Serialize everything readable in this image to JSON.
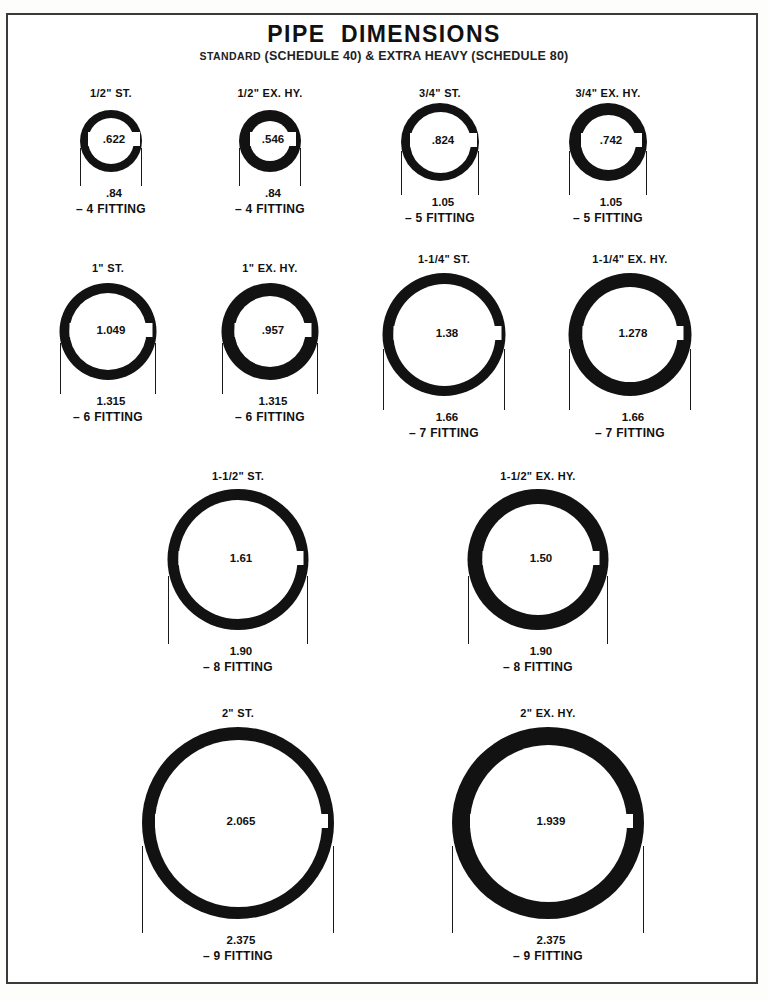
{
  "document": {
    "title": "PIPE  DIMENSIONS",
    "subtitle_small": "STANDARD",
    "subtitle_rest": "(SCHEDULE 40) & EXTRA HEAVY (SCHEDULE 80)",
    "border_color": "#3a3a3a",
    "ink_color": "#121212",
    "paper_color": "#ffffff"
  },
  "chart_data": {
    "type": "diagram",
    "title": "PIPE DIMENSIONS",
    "subtitle": "STANDARD (SCHEDULE 40) & EXTRA HEAVY (SCHEDULE 80)",
    "units": "inches",
    "scale_px_per_inch": 81,
    "columns": [
      "nominal_size",
      "schedule",
      "inside_diameter",
      "outside_diameter",
      "fitting"
    ],
    "pipes": [
      {
        "label": "1/2\" ST.",
        "nominal_size": "1/2\"",
        "schedule": "ST.",
        "id": ".622",
        "od": ".84",
        "fitting": "– 4 FITTING",
        "id_value": 0.622,
        "od_value": 0.84
      },
      {
        "label": "1/2\" EX. HY.",
        "nominal_size": "1/2\"",
        "schedule": "EX. HY.",
        "id": ".546",
        "od": ".84",
        "fitting": "– 4 FITTING",
        "id_value": 0.546,
        "od_value": 0.84
      },
      {
        "label": "3/4\" ST.",
        "nominal_size": "3/4\"",
        "schedule": "ST.",
        "id": ".824",
        "od": "1.05",
        "fitting": "– 5 FITTING",
        "id_value": 0.824,
        "od_value": 1.05
      },
      {
        "label": "3/4\" EX. HY.",
        "nominal_size": "3/4\"",
        "schedule": "EX. HY.",
        "id": ".742",
        "od": "1.05",
        "fitting": "– 5 FITTING",
        "id_value": 0.742,
        "od_value": 1.05
      },
      {
        "label": "1\" ST.",
        "nominal_size": "1\"",
        "schedule": "ST.",
        "id": "1.049",
        "od": "1.315",
        "fitting": "– 6 FITTING",
        "id_value": 1.049,
        "od_value": 1.315
      },
      {
        "label": "1\" EX. HY.",
        "nominal_size": "1\"",
        "schedule": "EX. HY.",
        "id": ".957",
        "od": "1.315",
        "fitting": "– 6 FITTING",
        "id_value": 0.957,
        "od_value": 1.315
      },
      {
        "label": "1-1/4\" ST.",
        "nominal_size": "1-1/4\"",
        "schedule": "ST.",
        "id": "1.38",
        "od": "1.66",
        "fitting": "– 7 FITTING",
        "id_value": 1.38,
        "od_value": 1.66
      },
      {
        "label": "1-1/4\" EX. HY.",
        "nominal_size": "1-1/4\"",
        "schedule": "EX. HY.",
        "id": "1.278",
        "od": "1.66",
        "fitting": "– 7 FITTING",
        "id_value": 1.278,
        "od_value": 1.66
      },
      {
        "label": "1-1/2\" ST.",
        "nominal_size": "1-1/2\"",
        "schedule": "ST.",
        "id": "1.61",
        "od": "1.90",
        "fitting": "– 8 FITTING",
        "id_value": 1.61,
        "od_value": 1.9
      },
      {
        "label": "1-1/2\" EX. HY.",
        "nominal_size": "1-1/2\"",
        "schedule": "EX. HY.",
        "id": "1.50",
        "od": "1.90",
        "fitting": "– 8 FITTING",
        "id_value": 1.5,
        "od_value": 1.9
      },
      {
        "label": "2\" ST.",
        "nominal_size": "2\"",
        "schedule": "ST.",
        "id": "2.065",
        "od": "2.375",
        "fitting": "– 9 FITTING",
        "id_value": 2.065,
        "od_value": 2.375
      },
      {
        "label": "2\" EX. HY.",
        "nominal_size": "2\"",
        "schedule": "EX. HY.",
        "id": "1.939",
        "od": "2.375",
        "fitting": "– 9 FITTING",
        "id_value": 1.939,
        "od_value": 2.375
      }
    ]
  },
  "layout": {
    "figures": [
      {
        "index": 0,
        "cx": 103,
        "label_y": 72,
        "ring_top": 95,
        "od_px": 62,
        "id_px": 46
      },
      {
        "index": 1,
        "cx": 262,
        "label_y": 72,
        "ring_top": 95,
        "od_px": 62,
        "id_px": 40
      },
      {
        "index": 2,
        "cx": 432,
        "label_y": 72,
        "ring_top": 88,
        "od_px": 78,
        "id_px": 61
      },
      {
        "index": 3,
        "cx": 600,
        "label_y": 72,
        "ring_top": 88,
        "od_px": 78,
        "id_px": 55
      },
      {
        "index": 4,
        "cx": 100,
        "label_y": 247,
        "ring_top": 268,
        "od_px": 97,
        "id_px": 77
      },
      {
        "index": 5,
        "cx": 262,
        "label_y": 247,
        "ring_top": 268,
        "od_px": 97,
        "id_px": 71
      },
      {
        "index": 6,
        "cx": 436,
        "label_y": 238,
        "ring_top": 258,
        "od_px": 123,
        "id_px": 102
      },
      {
        "index": 7,
        "cx": 622,
        "label_y": 238,
        "ring_top": 258,
        "od_px": 123,
        "id_px": 95
      },
      {
        "index": 8,
        "cx": 230,
        "label_y": 455,
        "ring_top": 474,
        "od_px": 141,
        "id_px": 119
      },
      {
        "index": 9,
        "cx": 530,
        "label_y": 455,
        "ring_top": 474,
        "od_px": 141,
        "id_px": 111
      },
      {
        "index": 10,
        "cx": 230,
        "label_y": 692,
        "ring_top": 712,
        "od_px": 192,
        "id_px": 167
      },
      {
        "index": 11,
        "cx": 540,
        "label_y": 692,
        "ring_top": 712,
        "od_px": 192,
        "id_px": 157
      }
    ]
  }
}
